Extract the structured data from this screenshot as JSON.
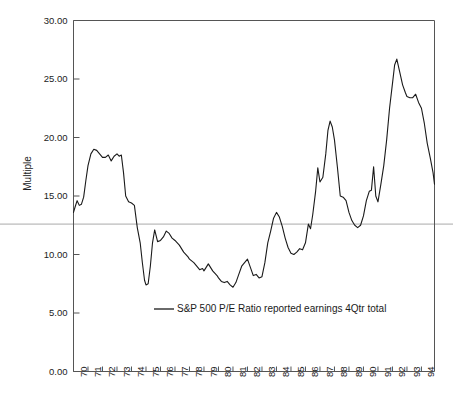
{
  "chart_data": {
    "type": "line",
    "title": "",
    "subtitle": "",
    "xlabel": "",
    "ylabel": "Multiple",
    "xlim": [
      1970.0,
      1994.9
    ],
    "ylim": [
      0.0,
      30.0
    ],
    "grid": false,
    "legend_position": "inside-bottom-center",
    "y_ticks": [
      0.0,
      5.0,
      10.0,
      15.0,
      20.0,
      25.0,
      30.0
    ],
    "y_tick_labels": [
      "0.00",
      "5.00",
      "10.00",
      "15.00",
      "20.00",
      "25.00",
      "30.00"
    ],
    "x_ticks": [
      1970,
      1971,
      1972,
      1973,
      1974,
      1975,
      1976,
      1977,
      1978,
      1979,
      1980,
      1981,
      1982,
      1983,
      1984,
      1985,
      1986,
      1987,
      1988,
      1989,
      1990,
      1991,
      1992,
      1993,
      1994
    ],
    "x_tick_labels": [
      "70",
      "71",
      "72",
      "73",
      "74",
      "75",
      "76",
      "77",
      "78",
      "79",
      "80",
      "81",
      "82",
      "83",
      "84",
      "85",
      "86",
      "87",
      "88",
      "89",
      "90",
      "91",
      "92",
      "93",
      "94"
    ],
    "reference_line": {
      "value": 12.6,
      "orientation": "horizontal",
      "color": "#aaaaaa",
      "label": ""
    },
    "line_color": "#1a1a1a",
    "series": [
      {
        "name": "S&P 500 P/E Ratio reported earnings 4Qtr total",
        "color": "#1a1a1a",
        "x": [
          1970.0,
          1970.12,
          1970.25,
          1970.4,
          1970.55,
          1970.7,
          1970.85,
          1971.0,
          1971.2,
          1971.4,
          1971.6,
          1971.8,
          1972.0,
          1972.2,
          1972.4,
          1972.6,
          1972.8,
          1973.0,
          1973.15,
          1973.3,
          1973.45,
          1973.6,
          1973.8,
          1974.0,
          1974.2,
          1974.4,
          1974.6,
          1974.75,
          1974.9,
          1975.0,
          1975.15,
          1975.3,
          1975.45,
          1975.6,
          1975.8,
          1976.0,
          1976.2,
          1976.4,
          1976.6,
          1976.8,
          1977.0,
          1977.3,
          1977.6,
          1977.9,
          1978.0,
          1978.3,
          1978.5,
          1978.7,
          1978.9,
          1979.0,
          1979.3,
          1979.6,
          1979.9,
          1980.0,
          1980.2,
          1980.4,
          1980.6,
          1980.8,
          1981.0,
          1981.2,
          1981.4,
          1981.6,
          1981.8,
          1982.0,
          1982.2,
          1982.4,
          1982.6,
          1982.8,
          1983.0,
          1983.2,
          1983.4,
          1983.6,
          1983.8,
          1984.0,
          1984.2,
          1984.4,
          1984.6,
          1984.8,
          1985.0,
          1985.2,
          1985.4,
          1985.6,
          1985.8,
          1986.0,
          1986.2,
          1986.35,
          1986.5,
          1986.7,
          1986.85,
          1987.0,
          1987.2,
          1987.4,
          1987.55,
          1987.7,
          1987.85,
          1988.0,
          1988.2,
          1988.4,
          1988.6,
          1988.8,
          1989.0,
          1989.2,
          1989.4,
          1989.6,
          1989.8,
          1990.0,
          1990.2,
          1990.4,
          1990.55,
          1990.7,
          1990.85,
          1991.0,
          1991.2,
          1991.4,
          1991.6,
          1991.8,
          1992.0,
          1992.15,
          1992.3,
          1992.5,
          1992.7,
          1992.9,
          1993.0,
          1993.2,
          1993.4,
          1993.6,
          1993.8,
          1994.0,
          1994.2,
          1994.4,
          1994.6,
          1994.8,
          1994.9
        ],
        "y": [
          13.6,
          14.1,
          14.6,
          14.2,
          14.3,
          14.9,
          16.3,
          17.6,
          18.6,
          19.0,
          18.9,
          18.6,
          18.3,
          18.3,
          18.5,
          18.0,
          18.4,
          18.6,
          18.4,
          18.5,
          17.0,
          15.0,
          14.5,
          14.4,
          14.2,
          12.3,
          11.0,
          9.3,
          7.8,
          7.4,
          7.5,
          9.0,
          11.0,
          12.1,
          11.1,
          11.2,
          11.5,
          12.0,
          11.8,
          11.4,
          11.2,
          10.8,
          10.2,
          9.8,
          9.6,
          9.3,
          9.0,
          8.7,
          8.8,
          8.6,
          9.2,
          8.6,
          8.2,
          8.0,
          7.7,
          7.6,
          7.7,
          7.4,
          7.2,
          7.6,
          8.3,
          9.0,
          9.3,
          9.6,
          8.9,
          8.2,
          8.3,
          8.0,
          8.1,
          9.3,
          11.0,
          12.0,
          13.1,
          13.6,
          13.2,
          12.4,
          11.4,
          10.6,
          10.1,
          10.0,
          10.2,
          10.5,
          10.4,
          11.0,
          12.6,
          12.2,
          13.4,
          15.4,
          17.4,
          16.2,
          16.6,
          18.6,
          20.6,
          21.4,
          20.9,
          19.8,
          17.5,
          15.0,
          14.9,
          14.6,
          13.6,
          12.9,
          12.5,
          12.3,
          12.5,
          13.3,
          14.6,
          15.4,
          15.5,
          17.5,
          15.0,
          14.5,
          16.0,
          17.6,
          19.8,
          22.5,
          24.6,
          26.2,
          26.7,
          25.6,
          24.5,
          23.8,
          23.5,
          23.4,
          23.4,
          23.7,
          23.0,
          22.5,
          21.2,
          19.5,
          18.3,
          17.0,
          16.0
        ]
      }
    ]
  },
  "axis": {
    "y_title": "Multiple"
  },
  "legend": {
    "entries": [
      {
        "label": "S&P 500 P/E Ratio reported earnings 4Qtr total",
        "color": "#1a1a1a"
      }
    ]
  }
}
